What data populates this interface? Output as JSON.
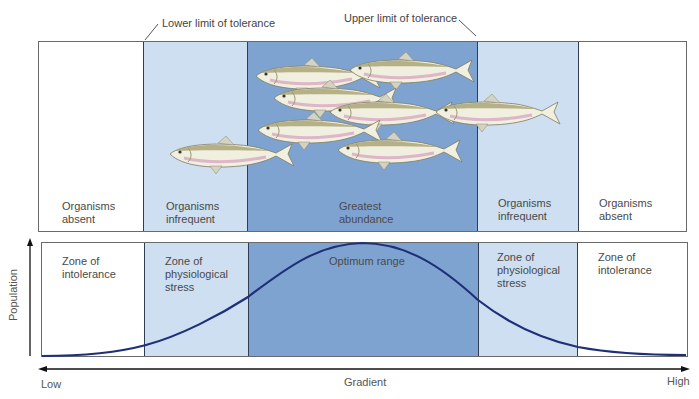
{
  "annotations": {
    "lower_limit": "Lower limit of tolerance",
    "upper_limit": "Upper limit of tolerance"
  },
  "colors": {
    "intolerance": "#ffffff",
    "stress": "#cddff0",
    "optimum": "#7ea3d1",
    "curve": "#1f2f78",
    "border": "#6a6a6a"
  },
  "top_panel": {
    "columns": [
      {
        "line1": "Organisms",
        "line2": "absent"
      },
      {
        "line1": "Organisms",
        "line2": "infrequent"
      },
      {
        "line1": "Greatest",
        "line2": "abundance"
      },
      {
        "line1": "Organisms",
        "line2": "infrequent"
      },
      {
        "line1": "Organisms",
        "line2": "absent"
      }
    ],
    "fish_count": 8
  },
  "bottom_panel": {
    "zones": [
      {
        "line1": "Zone of",
        "line2": "intolerance",
        "line3": ""
      },
      {
        "line1": "Zone of",
        "line2": "physiological",
        "line3": "stress"
      },
      {
        "line1": "Optimum range",
        "line2": "",
        "line3": ""
      },
      {
        "line1": "Zone of",
        "line2": "physiological",
        "line3": "stress"
      },
      {
        "line1": "Zone of",
        "line2": "intolerance",
        "line3": ""
      }
    ]
  },
  "axes": {
    "y_label": "Population",
    "x_label": "Gradient",
    "x_low": "Low",
    "x_high": "High"
  }
}
